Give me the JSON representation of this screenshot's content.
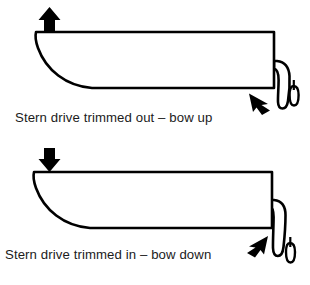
{
  "figure": {
    "name": "stern-drive-trim-diagram",
    "background_color": "#ffffff",
    "line_color": "#000000",
    "fill_color": "#ffffff",
    "text_color": "#1b1b1b"
  },
  "diagrams": [
    {
      "id": "trimmed-out",
      "caption": "Stern drive trimmed out – bow up",
      "vertical_arrow": {
        "icon": "arrow-up-icon",
        "direction": "up",
        "meaning": "bow rises"
      },
      "drive_arrow": {
        "icon": "arrow-right-icon",
        "direction": "right",
        "meaning": "drive angled out, away from transom"
      },
      "hull": {
        "icon": "boat-hull-profile-icon",
        "orientation": "bow left, stern right"
      },
      "stern_drive": {
        "icon": "stern-drive-unit-icon",
        "trim_state": "out",
        "angle_description": "tilted rearward away from transom"
      }
    },
    {
      "id": "trimmed-in",
      "caption": "Stern drive trimmed in – bow down",
      "vertical_arrow": {
        "icon": "arrow-down-icon",
        "direction": "down",
        "meaning": "bow drops"
      },
      "drive_arrow": {
        "icon": "arrow-left-icon",
        "direction": "left",
        "meaning": "drive angled in, toward transom"
      },
      "hull": {
        "icon": "boat-hull-profile-icon",
        "orientation": "bow left, stern right"
      },
      "stern_drive": {
        "icon": "stern-drive-unit-icon",
        "trim_state": "in",
        "angle_description": "held close to vertical against transom"
      }
    }
  ]
}
